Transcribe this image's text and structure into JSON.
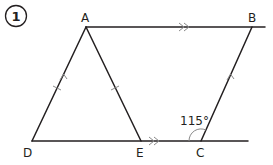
{
  "question_number": "1",
  "vertices": {
    "A": "A",
    "B": "B",
    "C": "C",
    "D": "D",
    "E": "E"
  },
  "angle_label": "115°",
  "markings": {
    "single_arrow_parallel": [
      "AD",
      "CB"
    ],
    "double_arrow_parallel": [
      "AB",
      "DC"
    ],
    "equal_length_ticks": [
      "AD",
      "AE"
    ],
    "marked_angle": "BCE"
  },
  "colors": {
    "line": "#231f20",
    "marker": "#8a8a8a"
  }
}
